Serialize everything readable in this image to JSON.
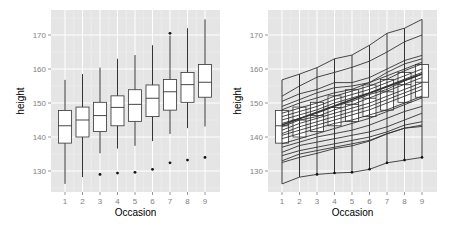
{
  "chart_data": [
    {
      "type": "boxplot",
      "title": "",
      "xlabel": "Occasion",
      "ylabel": "height",
      "ylim": [
        123.5,
        177
      ],
      "yticks": [
        130,
        140,
        150,
        160,
        170
      ],
      "categories": [
        "1",
        "2",
        "3",
        "4",
        "5",
        "6",
        "7",
        "8",
        "9"
      ],
      "grid": true,
      "background": "#e5e5e5",
      "boxes": [
        {
          "x": "1",
          "whisker_low": 126.2,
          "q1": 138.2,
          "median": 143.3,
          "q3": 147.8,
          "whisker_high": 156.8,
          "outliers": []
        },
        {
          "x": "2",
          "whisker_low": 128.2,
          "q1": 140.0,
          "median": 145.0,
          "q3": 148.8,
          "whisker_high": 158.5,
          "outliers": []
        },
        {
          "x": "3",
          "whisker_low": 135.2,
          "q1": 141.6,
          "median": 146.3,
          "q3": 150.2,
          "whisker_high": 160.4,
          "outliers": [
            129.0
          ]
        },
        {
          "x": "4",
          "whisker_low": 136.6,
          "q1": 143.3,
          "median": 148.7,
          "q3": 152.1,
          "whisker_high": 163.0,
          "outliers": [
            129.4
          ]
        },
        {
          "x": "5",
          "whisker_low": 137.4,
          "q1": 144.6,
          "median": 149.6,
          "q3": 153.9,
          "whisker_high": 164.1,
          "outliers": [
            129.6
          ]
        },
        {
          "x": "6",
          "whisker_low": 138.8,
          "q1": 146.0,
          "median": 151.4,
          "q3": 155.3,
          "whisker_high": 167.0,
          "outliers": [
            130.5
          ]
        },
        {
          "x": "7",
          "whisker_low": 140.9,
          "q1": 147.9,
          "median": 153.3,
          "q3": 156.9,
          "whisker_high": 169.8,
          "outliers": [
            132.4,
            170.5
          ]
        },
        {
          "x": "8",
          "whisker_low": 142.6,
          "q1": 150.2,
          "median": 155.4,
          "q3": 159.0,
          "whisker_high": 172.0,
          "outliers": [
            133.2
          ]
        },
        {
          "x": "9",
          "whisker_low": 143.1,
          "q1": 151.7,
          "median": 156.1,
          "q3": 161.3,
          "whisker_high": 174.6,
          "outliers": [
            134.0
          ]
        }
      ]
    },
    {
      "type": "boxplot+line",
      "title": "",
      "xlabel": "Occasion",
      "ylabel": "height",
      "ylim": [
        123.5,
        177
      ],
      "yticks": [
        130,
        140,
        150,
        160,
        170
      ],
      "categories": [
        "1",
        "2",
        "3",
        "4",
        "5",
        "6",
        "7",
        "8",
        "9"
      ],
      "grid": true,
      "background": "#e5e5e5",
      "boxes_same_as_left": true,
      "boxes": [
        {
          "x": "1",
          "q1": 138.2,
          "median": 143.3,
          "q3": 147.8
        },
        {
          "x": "2",
          "q1": 140.0,
          "median": 145.0,
          "q3": 148.8
        },
        {
          "x": "3",
          "q1": 141.6,
          "median": 146.3,
          "q3": 150.2
        },
        {
          "x": "4",
          "q1": 143.3,
          "median": 148.7,
          "q3": 152.1
        },
        {
          "x": "5",
          "q1": 144.6,
          "median": 149.6,
          "q3": 153.9
        },
        {
          "x": "6",
          "q1": 146.0,
          "median": 151.4,
          "q3": 155.3
        },
        {
          "x": "7",
          "q1": 147.9,
          "median": 153.3,
          "q3": 156.9
        },
        {
          "x": "8",
          "q1": 150.2,
          "median": 155.4,
          "q3": 159.0
        },
        {
          "x": "9",
          "q1": 151.7,
          "median": 156.1,
          "q3": 161.3
        }
      ],
      "series": [
        {
          "name": "subject-1",
          "values": [
            156.8,
            158.5,
            160.4,
            163.0,
            164.1,
            167.0,
            170.5,
            172.0,
            174.6
          ]
        },
        {
          "name": "subject-2",
          "values": [
            152.0,
            155.0,
            157.6,
            159.0,
            160.5,
            162.3,
            165.0,
            168.0,
            170.0
          ]
        },
        {
          "name": "subject-3",
          "values": [
            150.5,
            152.7,
            154.0,
            156.0,
            156.0,
            157.5,
            160.0,
            162.5,
            164.0
          ]
        },
        {
          "name": "subject-4",
          "values": [
            149.0,
            151.0,
            153.0,
            154.5,
            155.0,
            156.0,
            159.0,
            161.5,
            163.0
          ]
        },
        {
          "name": "subject-5",
          "values": [
            148.0,
            150.0,
            151.5,
            153.0,
            154.0,
            156.0,
            158.0,
            160.0,
            162.0
          ]
        },
        {
          "name": "subject-6",
          "values": [
            147.0,
            148.5,
            150.0,
            152.0,
            153.5,
            155.0,
            157.0,
            159.5,
            161.5
          ]
        },
        {
          "name": "subject-7",
          "values": [
            146.0,
            147.5,
            149.0,
            151.0,
            152.5,
            154.0,
            156.0,
            158.0,
            160.0
          ]
        },
        {
          "name": "subject-8",
          "values": [
            145.0,
            146.5,
            148.0,
            150.0,
            151.5,
            153.0,
            155.0,
            157.0,
            159.0
          ]
        },
        {
          "name": "subject-9",
          "values": [
            144.0,
            145.5,
            147.0,
            149.0,
            150.5,
            152.5,
            154.0,
            156.5,
            158.5
          ]
        },
        {
          "name": "subject-10",
          "values": [
            143.0,
            145.0,
            146.0,
            148.0,
            149.5,
            151.5,
            153.5,
            155.5,
            157.5
          ]
        },
        {
          "name": "subject-11",
          "values": [
            142.0,
            144.0,
            145.5,
            147.0,
            148.5,
            150.0,
            152.0,
            154.0,
            156.0
          ]
        },
        {
          "name": "subject-12",
          "values": [
            141.0,
            143.0,
            144.5,
            146.0,
            147.5,
            149.0,
            151.0,
            153.0,
            155.0
          ]
        },
        {
          "name": "subject-13",
          "values": [
            140.5,
            142.0,
            143.5,
            145.0,
            146.5,
            148.0,
            150.0,
            152.0,
            154.0
          ]
        },
        {
          "name": "subject-14",
          "values": [
            139.5,
            141.0,
            142.5,
            144.0,
            145.0,
            146.5,
            148.0,
            150.0,
            152.0
          ]
        },
        {
          "name": "subject-15",
          "values": [
            138.0,
            139.5,
            141.0,
            142.5,
            144.0,
            145.5,
            147.5,
            149.5,
            151.5
          ]
        },
        {
          "name": "subject-16",
          "values": [
            137.0,
            138.5,
            140.0,
            141.0,
            142.0,
            143.5,
            145.5,
            147.5,
            149.0
          ]
        },
        {
          "name": "subject-17",
          "values": [
            135.5,
            137.5,
            138.5,
            139.5,
            140.5,
            141.5,
            143.0,
            145.0,
            147.0
          ]
        },
        {
          "name": "subject-18",
          "values": [
            134.5,
            136.0,
            137.0,
            138.0,
            139.0,
            140.0,
            141.5,
            143.5,
            144.5
          ]
        },
        {
          "name": "subject-19",
          "values": [
            133.0,
            135.0,
            136.0,
            137.0,
            138.0,
            139.0,
            141.0,
            142.6,
            143.5
          ]
        },
        {
          "name": "subject-20",
          "values": [
            132.5,
            134.0,
            135.2,
            136.6,
            137.4,
            138.8,
            140.9,
            142.6,
            143.1
          ]
        },
        {
          "name": "subject-21",
          "values": [
            126.2,
            128.2,
            129.0,
            129.4,
            129.6,
            130.5,
            132.4,
            133.2,
            134.0
          ]
        }
      ]
    }
  ],
  "panels": [
    {
      "xlabel": "Occasion",
      "ylabel": "height",
      "yticks": [
        "130",
        "140",
        "150",
        "160",
        "170"
      ],
      "xticks": [
        "1",
        "2",
        "3",
        "4",
        "5",
        "6",
        "7",
        "8",
        "9"
      ]
    },
    {
      "xlabel": "Occasion",
      "ylabel": "height",
      "yticks": [
        "130",
        "140",
        "150",
        "160",
        "170"
      ],
      "xticks": [
        "1",
        "2",
        "3",
        "4",
        "5",
        "6",
        "7",
        "8",
        "9"
      ]
    }
  ],
  "colors": {
    "panel_bg": "#e5e5e5",
    "grid": "#ffffff",
    "ink": "#333333",
    "tick_text": "#7f7f7f"
  }
}
